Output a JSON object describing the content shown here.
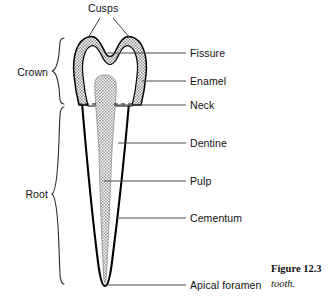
{
  "figure": {
    "caption_title": "Figure 12.3",
    "caption_sub": "tooth.",
    "colors": {
      "outline": "#000000",
      "enamel_fill": "#b8b8b8",
      "dentine_fill": "#ffffff",
      "pulp_fill": "#b0b0b0",
      "leader": "#4a4a4a",
      "text": "#111111"
    }
  },
  "labels": {
    "top": {
      "cusps": "Cusps"
    },
    "left": [
      {
        "id": "crown",
        "text": "Crown"
      },
      {
        "id": "root",
        "text": "Root"
      }
    ],
    "right": [
      {
        "id": "fissure",
        "text": "Fissure"
      },
      {
        "id": "enamel",
        "text": "Enamel"
      },
      {
        "id": "neck",
        "text": "Neck"
      },
      {
        "id": "dentine",
        "text": "Dentine"
      },
      {
        "id": "pulp",
        "text": "Pulp"
      },
      {
        "id": "cementum",
        "text": "Cementum"
      },
      {
        "id": "apical_foramen",
        "text": "Apical foramen"
      }
    ]
  }
}
